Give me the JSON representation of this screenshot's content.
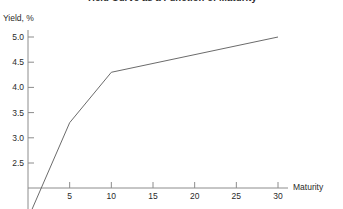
{
  "chart_data": {
    "type": "line",
    "title": "Yield Curve as a Function of Maturity",
    "xlabel": "Maturity",
    "ylabel": "Yield, %",
    "xlim": [
      0,
      31
    ],
    "ylim": [
      2.0,
      5.2
    ],
    "grid": false,
    "legend": null,
    "xticks": [
      5,
      10,
      15,
      20,
      25,
      30
    ],
    "xtick_labels": [
      "5",
      "10",
      "15",
      "20",
      "25",
      "30"
    ],
    "yticks": [
      2.5,
      3.0,
      3.5,
      4.0,
      4.5,
      5.0
    ],
    "ytick_labels": [
      "2.5",
      "3.0",
      "3.5",
      "4.0",
      "4.5",
      "5.0"
    ],
    "series": [
      {
        "name": "Yield curve",
        "color": "#6b6b6b",
        "x": [
          0.4,
          5,
          10,
          30
        ],
        "y": [
          1.55,
          3.3,
          4.3,
          5.0
        ]
      }
    ]
  },
  "axis": {
    "x_axis_color": "#8c8c8c",
    "y_axis_color": "#8c8c8c"
  }
}
